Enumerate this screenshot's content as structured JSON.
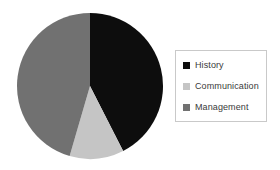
{
  "chart_data": {
    "type": "pie",
    "title": "",
    "categories": [
      "History",
      "Communication",
      "Management"
    ],
    "values": [
      42.5,
      12.0,
      45.5
    ],
    "colors": [
      "#0d0d0d",
      "#c5c5c5",
      "#717171"
    ],
    "start_angle_deg": 0,
    "direction": "clockwise",
    "legend_position": "right",
    "grid": false,
    "slices": [
      {
        "label": "History",
        "value": 42.5,
        "color": "#0d0d0d",
        "start_deg": 0.0,
        "end_deg": 153.0
      },
      {
        "label": "Communication",
        "value": 12.0,
        "color": "#c5c5c5",
        "start_deg": 153.0,
        "end_deg": 196.2
      },
      {
        "label": "Management",
        "value": 45.5,
        "color": "#717171",
        "start_deg": 196.2,
        "end_deg": 360.0
      }
    ]
  },
  "legend": {
    "border_color": "#c9c9c9",
    "items": [
      {
        "label": "History",
        "color": "#0d0d0d",
        "swatch_name": "legend-swatch-history"
      },
      {
        "label": "Communication",
        "color": "#c5c5c5",
        "swatch_name": "legend-swatch-communication"
      },
      {
        "label": "Management",
        "color": "#717171",
        "swatch_name": "legend-swatch-management"
      }
    ]
  },
  "canvas": {
    "background": "#ffffff",
    "pie_center_x": 74,
    "pie_center_y": 74,
    "pie_radius": 73
  }
}
